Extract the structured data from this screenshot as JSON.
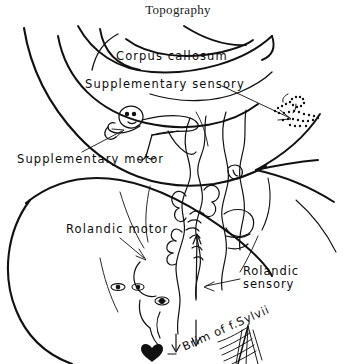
{
  "figure": {
    "title": "Topography",
    "type": "anatomical-line-drawing",
    "ink_color": "#111111",
    "background_color": "#ffffff"
  },
  "labels": {
    "corpus_callosum": "Corpus callosum",
    "supplementary_sensory": "Supplementary sensory",
    "supplementary_motor": "Supplementary motor",
    "rolandic_motor": "Rolandic motor",
    "rolandic_sensory_line1": "Rolandic",
    "rolandic_sensory_line2": "sensory",
    "brim_of_fissure": "Brim of f.Sylvii"
  },
  "features": [
    {
      "name": "brain-outline",
      "description": "large sweeping hemisphere contour on left"
    },
    {
      "name": "corpus-callosum-arcs",
      "description": "nested arcs across upper middle"
    },
    {
      "name": "supplementary-motor-homunculus",
      "description": "small reclining human figure, solid outline"
    },
    {
      "name": "supplementary-sensory-homunculus",
      "description": "small stippled/dotted human figure at upper right"
    },
    {
      "name": "rolandic-motor-homunculus",
      "description": "elongated figure along precentral bank"
    },
    {
      "name": "rolandic-sensory-homunculus",
      "description": "elongated figure along postcentral bank"
    },
    {
      "name": "sylvian-fissure-brim",
      "description": "hatched fan-shaped wedge at lower right"
    }
  ],
  "leaders": [
    {
      "name": "supplementary-sensory-arrow",
      "from": "Supplementary sensory",
      "points_to": "stippled homunculus upper right"
    },
    {
      "name": "supplementary-motor-arrow",
      "from": "Supplementary motor",
      "points_to": "reclining homunculus"
    },
    {
      "name": "rolandic-motor-arrow",
      "from": "Rolandic motor",
      "points_to": "precentral bank"
    },
    {
      "name": "rolandic-sensory-arrow",
      "from": "Rolandic sensory",
      "points_to": "postcentral bank"
    }
  ]
}
